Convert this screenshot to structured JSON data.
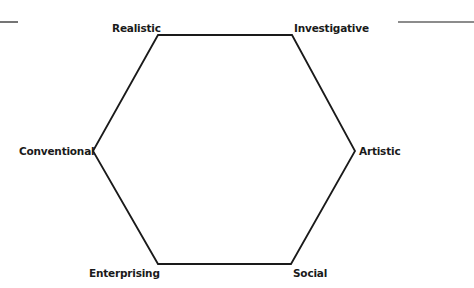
{
  "diagram": {
    "type": "hexagon",
    "stroke_color": "#1a1a1a",
    "background": "#ffffff",
    "vertices": [
      {
        "name": "Realistic",
        "x": 158,
        "y": 35
      },
      {
        "name": "Investigative",
        "x": 292,
        "y": 35
      },
      {
        "name": "Artistic",
        "x": 355,
        "y": 151
      },
      {
        "name": "Social",
        "x": 291,
        "y": 264
      },
      {
        "name": "Enterprising",
        "x": 158,
        "y": 264
      },
      {
        "name": "Conventional",
        "x": 93,
        "y": 151
      }
    ],
    "labels": {
      "realistic": "Realistic",
      "investigative": "Investigative",
      "artistic": "Artistic",
      "social": "Social",
      "enterprising": "Enterprising",
      "conventional": "Conventional"
    }
  }
}
